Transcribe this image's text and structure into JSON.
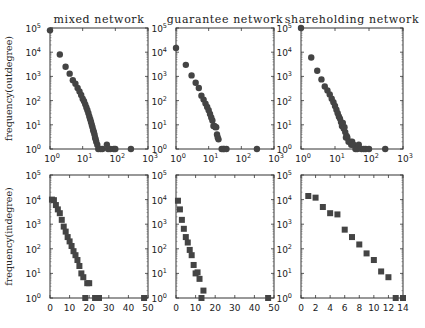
{
  "chart_data": [
    {
      "id": "mixed-out",
      "type": "scatter",
      "title": "mixed network",
      "ylabel": "frequency(outdegree)",
      "xscale": "log",
      "yscale": "log",
      "xlim": [
        1,
        1000
      ],
      "ylim": [
        1,
        100000
      ],
      "xticks": [
        "10^0",
        "10^1",
        "10^2",
        "10^3"
      ],
      "yticks": [
        "10^0",
        "10^1",
        "10^2",
        "10^3",
        "10^4",
        "10^5"
      ],
      "marker": "circle",
      "points": [
        [
          1,
          80000
        ],
        [
          2,
          8000
        ],
        [
          3,
          2500
        ],
        [
          4,
          1300
        ],
        [
          5,
          700
        ],
        [
          6,
          500
        ],
        [
          7,
          330
        ],
        [
          8,
          240
        ],
        [
          9,
          170
        ],
        [
          10,
          120
        ],
        [
          11,
          95
        ],
        [
          12,
          70
        ],
        [
          13,
          52
        ],
        [
          14,
          40
        ],
        [
          15,
          30
        ],
        [
          16,
          22
        ],
        [
          17,
          17
        ],
        [
          18,
          13
        ],
        [
          19,
          10
        ],
        [
          20,
          8
        ],
        [
          21,
          6
        ],
        [
          22,
          5
        ],
        [
          23,
          4
        ],
        [
          24,
          3
        ],
        [
          25,
          2.5
        ],
        [
          26,
          2
        ],
        [
          28,
          1.5
        ],
        [
          30,
          1
        ],
        [
          35,
          1
        ],
        [
          40,
          1
        ],
        [
          55,
          1.5
        ],
        [
          60,
          1
        ],
        [
          70,
          1
        ],
        [
          90,
          1
        ],
        [
          100,
          1
        ],
        [
          300,
          1
        ]
      ]
    },
    {
      "id": "guarantee-out",
      "type": "scatter",
      "title": "guarantee network",
      "ylabel": "",
      "xscale": "log",
      "yscale": "log",
      "xlim": [
        1,
        1000
      ],
      "ylim": [
        1,
        100000
      ],
      "xticks": [
        "10^0",
        "10^1",
        "10^2",
        "10^3"
      ],
      "yticks": [
        "10^0",
        "10^1",
        "10^2",
        "10^3",
        "10^4",
        "10^5"
      ],
      "marker": "circle",
      "points": [
        [
          1,
          15000
        ],
        [
          2,
          3000
        ],
        [
          3,
          1100
        ],
        [
          4,
          550
        ],
        [
          5,
          330
        ],
        [
          6,
          160
        ],
        [
          7,
          110
        ],
        [
          8,
          75
        ],
        [
          9,
          55
        ],
        [
          10,
          40
        ],
        [
          11,
          28
        ],
        [
          12,
          20
        ],
        [
          13,
          15
        ],
        [
          14,
          9
        ],
        [
          15,
          9
        ],
        [
          16,
          8
        ],
        [
          17,
          8
        ],
        [
          18,
          4
        ],
        [
          19,
          3
        ],
        [
          20,
          2.5
        ],
        [
          25,
          1
        ],
        [
          28,
          1
        ],
        [
          30,
          1
        ],
        [
          35,
          1
        ],
        [
          300,
          1
        ]
      ]
    },
    {
      "id": "shareholding-out",
      "type": "scatter",
      "title": "shareholding network",
      "ylabel": "",
      "xscale": "log",
      "yscale": "log",
      "xlim": [
        1,
        1000
      ],
      "ylim": [
        1,
        100000
      ],
      "xticks": [
        "10^0",
        "10^1",
        "10^2",
        "10^3"
      ],
      "yticks": [
        "10^0",
        "10^1",
        "10^2",
        "10^3",
        "10^4",
        "10^5"
      ],
      "marker": "circle",
      "points": [
        [
          1,
          100000
        ],
        [
          2,
          6000
        ],
        [
          3,
          1700
        ],
        [
          4,
          750
        ],
        [
          5,
          380
        ],
        [
          6,
          260
        ],
        [
          7,
          180
        ],
        [
          8,
          120
        ],
        [
          9,
          85
        ],
        [
          10,
          60
        ],
        [
          11,
          42
        ],
        [
          12,
          30
        ],
        [
          13,
          22
        ],
        [
          14,
          18
        ],
        [
          15,
          13
        ],
        [
          16,
          9
        ],
        [
          17,
          12
        ],
        [
          18,
          7
        ],
        [
          19,
          8
        ],
        [
          20,
          5
        ],
        [
          21,
          3
        ],
        [
          22,
          3.5
        ],
        [
          23,
          3
        ],
        [
          25,
          2
        ],
        [
          28,
          2
        ],
        [
          30,
          1.5
        ],
        [
          32,
          2
        ],
        [
          35,
          1.5
        ],
        [
          40,
          1
        ],
        [
          45,
          1
        ],
        [
          50,
          1.5
        ],
        [
          60,
          1
        ],
        [
          70,
          1
        ],
        [
          80,
          1
        ],
        [
          100,
          1
        ],
        [
          300,
          1
        ]
      ]
    },
    {
      "id": "mixed-in",
      "type": "scatter",
      "title": "",
      "ylabel": "frequency(indegree)",
      "xscale": "linear",
      "yscale": "log",
      "xlim": [
        0,
        50
      ],
      "ylim": [
        1,
        100000
      ],
      "xticks": [
        "0",
        "10",
        "20",
        "30",
        "40",
        "50"
      ],
      "xtickvals": [
        0,
        10,
        20,
        30,
        40,
        50
      ],
      "yticks": [
        "10^0",
        "10^1",
        "10^2",
        "10^3",
        "10^4",
        "10^5"
      ],
      "marker": "square",
      "points": [
        [
          1,
          10000
        ],
        [
          2,
          9500
        ],
        [
          3,
          6000
        ],
        [
          4,
          4000
        ],
        [
          5,
          2800
        ],
        [
          6,
          1500
        ],
        [
          7,
          800
        ],
        [
          8,
          500
        ],
        [
          9,
          300
        ],
        [
          10,
          200
        ],
        [
          11,
          130
        ],
        [
          12,
          80
        ],
        [
          13,
          55
        ],
        [
          14,
          35
        ],
        [
          15,
          20
        ],
        [
          16,
          10
        ],
        [
          17,
          7
        ],
        [
          19,
          4
        ],
        [
          20,
          4
        ],
        [
          18,
          1
        ],
        [
          23,
          1
        ],
        [
          24,
          1
        ],
        [
          25,
          1
        ],
        [
          48,
          1
        ]
      ]
    },
    {
      "id": "guarantee-in",
      "type": "scatter",
      "title": "",
      "ylabel": "",
      "xscale": "linear",
      "yscale": "log",
      "xlim": [
        0,
        50
      ],
      "ylim": [
        1,
        100000
      ],
      "xticks": [
        "0",
        "10",
        "20",
        "30",
        "40",
        "50"
      ],
      "xtickvals": [
        0,
        10,
        20,
        30,
        40,
        50
      ],
      "yticks": [
        "10^0",
        "10^1",
        "10^2",
        "10^3",
        "10^4",
        "10^5"
      ],
      "marker": "square",
      "points": [
        [
          1,
          9000
        ],
        [
          2,
          4000
        ],
        [
          3,
          1500
        ],
        [
          4,
          650
        ],
        [
          5,
          300
        ],
        [
          6,
          180
        ],
        [
          7,
          90
        ],
        [
          8,
          55
        ],
        [
          9,
          22
        ],
        [
          10,
          10
        ],
        [
          11,
          11
        ],
        [
          12,
          6
        ],
        [
          13,
          1
        ],
        [
          14,
          2
        ],
        [
          47,
          1
        ]
      ]
    },
    {
      "id": "shareholding-in",
      "type": "scatter",
      "title": "",
      "ylabel": "",
      "xscale": "linear",
      "yscale": "log",
      "xlim": [
        0,
        14
      ],
      "ylim": [
        1,
        100000
      ],
      "xticks": [
        "0",
        "2",
        "4",
        "6",
        "8",
        "10",
        "12",
        "14"
      ],
      "xtickvals": [
        0,
        2,
        4,
        6,
        8,
        10,
        12,
        14
      ],
      "yticks": [
        "10^0",
        "10^1",
        "10^2",
        "10^3",
        "10^4",
        "10^5"
      ],
      "marker": "square",
      "points": [
        [
          1,
          14000
        ],
        [
          2,
          12000
        ],
        [
          3,
          5000
        ],
        [
          4,
          2800
        ],
        [
          5,
          2500
        ],
        [
          6,
          600
        ],
        [
          7,
          300
        ],
        [
          8,
          150
        ],
        [
          9,
          65
        ],
        [
          10,
          35
        ],
        [
          11,
          12
        ],
        [
          12,
          7
        ],
        [
          13,
          1
        ],
        [
          14,
          1
        ]
      ]
    }
  ],
  "layout": {
    "panels": [
      {
        "x": 50,
        "y": 28,
        "w": 98,
        "h": 121
      },
      {
        "x": 176,
        "y": 28,
        "w": 98,
        "h": 121
      },
      {
        "x": 301,
        "y": 28,
        "w": 102,
        "h": 121
      },
      {
        "x": 50,
        "y": 175,
        "w": 98,
        "h": 123
      },
      {
        "x": 176,
        "y": 175,
        "w": 98,
        "h": 123
      },
      {
        "x": 301,
        "y": 175,
        "w": 102,
        "h": 123
      }
    ]
  }
}
